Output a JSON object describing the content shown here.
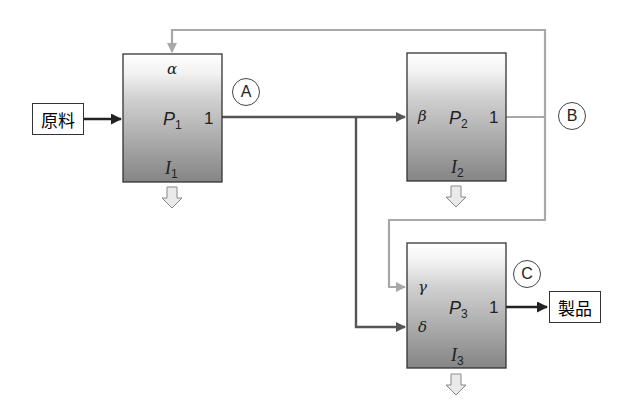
{
  "colors": {
    "main_flow": "#555555",
    "feedback_flow": "#a8a8a8",
    "box_gradient_top": "#ffffff",
    "box_gradient_bottom": "#808080",
    "border": "#333333",
    "waste_arrow_fill": "#e8e8e8"
  },
  "input": {
    "label": "原料"
  },
  "output": {
    "label": "製品"
  },
  "processes": [
    {
      "id": "P1",
      "name": "P",
      "sub": "1",
      "inventory": "I",
      "inventory_sub": "1",
      "output_port": "1",
      "inputs": [
        "α"
      ],
      "marker": "A"
    },
    {
      "id": "P2",
      "name": "P",
      "sub": "2",
      "inventory": "I",
      "inventory_sub": "2",
      "output_port": "1",
      "inputs": [
        "β"
      ],
      "marker": "B"
    },
    {
      "id": "P3",
      "name": "P",
      "sub": "3",
      "inventory": "I",
      "inventory_sub": "3",
      "output_port": "1",
      "inputs": [
        "γ",
        "δ"
      ],
      "marker": "C"
    }
  ]
}
